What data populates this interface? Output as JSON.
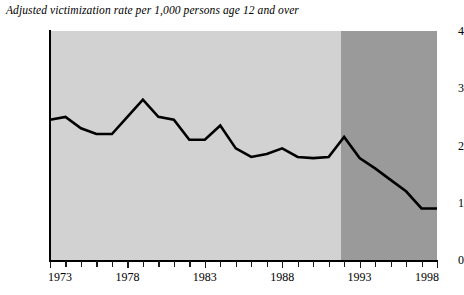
{
  "chart_data": {
    "type": "line",
    "title": "Adjusted victimization rate per 1,000 persons age 12 and over",
    "xlabel": "",
    "ylabel": "",
    "xlim": [
      1973,
      1998
    ],
    "ylim": [
      0,
      4
    ],
    "grid": false,
    "legend": null,
    "x": [
      1973,
      1974,
      1975,
      1976,
      1977,
      1978,
      1979,
      1980,
      1981,
      1982,
      1983,
      1984,
      1985,
      1986,
      1987,
      1988,
      1989,
      1990,
      1991,
      1992,
      1993,
      1994,
      1995,
      1996,
      1997,
      1998
    ],
    "series": [
      {
        "name": "Adjusted victimization rate",
        "values": [
          2.45,
          2.5,
          2.3,
          2.2,
          2.2,
          2.5,
          2.8,
          2.5,
          2.45,
          2.1,
          2.1,
          2.35,
          1.95,
          1.8,
          1.85,
          1.95,
          1.8,
          1.78,
          1.8,
          2.15,
          1.78,
          1.6,
          1.4,
          1.2,
          0.9,
          0.9
        ]
      }
    ],
    "yticks": [
      0,
      1,
      2,
      3,
      4
    ],
    "ytick_labels": [
      "0",
      "1",
      "2",
      "3",
      "4"
    ],
    "xticks": [
      1973,
      1974,
      1975,
      1976,
      1977,
      1978,
      1979,
      1980,
      1981,
      1982,
      1983,
      1984,
      1985,
      1986,
      1987,
      1988,
      1989,
      1990,
      1991,
      1992,
      1993,
      1994,
      1995,
      1996,
      1997,
      1998
    ],
    "xtick_labels": [
      "1973",
      "1978",
      "1983",
      "1988",
      "1993",
      "1998"
    ],
    "xtick_label_years": [
      1973,
      1978,
      1983,
      1988,
      1993,
      1998
    ],
    "shaded_regions": [
      {
        "name": "light-period",
        "from": 1973,
        "to": 1991.8,
        "color": "#d2d2d2"
      },
      {
        "name": "dark-period",
        "from": 1991.8,
        "to": 1998,
        "color": "#9a9a9a"
      }
    ],
    "line_color": "#000000",
    "background_color": "#ffffff"
  }
}
